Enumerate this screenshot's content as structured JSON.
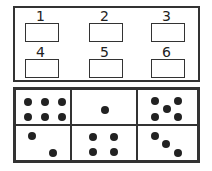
{
  "answer_boxes": [
    {
      "label": "1",
      "value": ""
    },
    {
      "label": "2",
      "value": ""
    },
    {
      "label": "3",
      "value": ""
    },
    {
      "label": "4",
      "value": ""
    },
    {
      "label": "5",
      "value": ""
    },
    {
      "label": "6",
      "value": ""
    }
  ],
  "dice_cards": [
    {
      "dots": 6
    },
    {
      "dots": 1
    },
    {
      "dots": 5
    },
    {
      "dots": 2
    },
    {
      "dots": 4
    },
    {
      "dots": 3
    }
  ]
}
